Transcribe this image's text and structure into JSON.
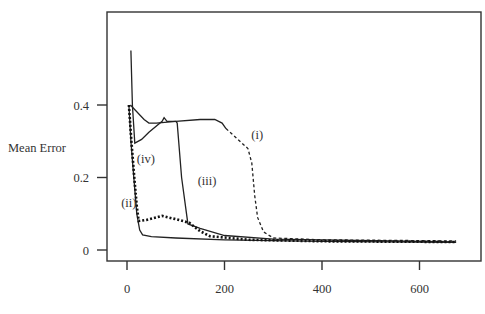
{
  "chart_data": {
    "type": "line",
    "title": "",
    "xlabel": "",
    "ylabel": "Mean Error",
    "xlim": [
      -40,
      725
    ],
    "ylim": [
      -0.03,
      0.65
    ],
    "x_ticks": [
      0,
      200,
      400,
      600
    ],
    "x_tick_labels": [
      "0",
      "200",
      "400",
      "600"
    ],
    "y_ticks": [
      0,
      0.2,
      0.4
    ],
    "y_tick_labels": [
      "0",
      "0.2",
      "0.4"
    ],
    "grid": false,
    "legend": "none (inline curve labels)",
    "series": [
      {
        "name": "(i)",
        "style": "solid-then-dashed",
        "solid_points": [
          [
            7,
            0.4
          ],
          [
            35,
            0.36
          ],
          [
            45,
            0.35
          ],
          [
            60,
            0.35
          ],
          [
            100,
            0.355
          ],
          [
            150,
            0.36
          ],
          [
            180,
            0.36
          ],
          [
            195,
            0.35
          ],
          [
            203,
            0.335
          ]
        ],
        "dashed_points": [
          [
            203,
            0.335
          ],
          [
            248,
            0.28
          ],
          [
            256,
            0.24
          ],
          [
            262,
            0.15
          ],
          [
            268,
            0.09
          ],
          [
            280,
            0.05
          ],
          [
            300,
            0.033
          ],
          [
            400,
            0.028
          ],
          [
            675,
            0.025
          ]
        ]
      },
      {
        "name": "(ii)",
        "style": "solid",
        "points": [
          [
            4,
            0.4
          ],
          [
            8,
            0.3
          ],
          [
            14,
            0.2
          ],
          [
            20,
            0.1
          ],
          [
            26,
            0.055
          ],
          [
            32,
            0.042
          ],
          [
            50,
            0.037
          ],
          [
            100,
            0.033
          ],
          [
            200,
            0.028
          ],
          [
            400,
            0.024
          ],
          [
            675,
            0.021
          ]
        ]
      },
      {
        "name": "(iii)",
        "style": "solid",
        "points": [
          [
            8,
            0.55
          ],
          [
            11,
            0.4
          ],
          [
            16,
            0.295
          ],
          [
            30,
            0.305
          ],
          [
            45,
            0.325
          ],
          [
            72,
            0.355
          ],
          [
            76,
            0.365
          ],
          [
            82,
            0.355
          ],
          [
            100,
            0.355
          ],
          [
            103,
            0.35
          ],
          [
            112,
            0.2
          ],
          [
            125,
            0.072
          ],
          [
            150,
            0.06
          ],
          [
            200,
            0.04
          ],
          [
            300,
            0.03
          ],
          [
            675,
            0.022
          ]
        ]
      },
      {
        "name": "(iv)",
        "style": "dotted",
        "points": [
          [
            4,
            0.4
          ],
          [
            9,
            0.3
          ],
          [
            15,
            0.2
          ],
          [
            20,
            0.12
          ],
          [
            24,
            0.08
          ],
          [
            40,
            0.083
          ],
          [
            72,
            0.094
          ],
          [
            100,
            0.085
          ],
          [
            128,
            0.075
          ],
          [
            150,
            0.052
          ],
          [
            170,
            0.038
          ],
          [
            250,
            0.028
          ],
          [
            400,
            0.024
          ],
          [
            675,
            0.022
          ]
        ]
      }
    ],
    "annotations": [
      {
        "text": "(i)",
        "x": 255,
        "y": 0.305
      },
      {
        "text": "(ii)",
        "x": -12,
        "y": 0.12
      },
      {
        "text": "(iii)",
        "x": 145,
        "y": 0.18
      },
      {
        "text": "(iv)",
        "x": 20,
        "y": 0.24
      }
    ]
  }
}
